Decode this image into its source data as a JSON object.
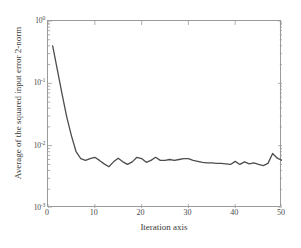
{
  "chart_data": {
    "type": "line",
    "title": "",
    "xlabel": "Iteration axis",
    "ylabel": "Average of the squared input error 2-norm",
    "xlim": [
      0,
      50
    ],
    "ylim": [
      0.001,
      1
    ],
    "yscale": "log",
    "xscale": "linear",
    "grid": false,
    "legend": null,
    "line_color": "#4d4d4d",
    "line_width": 1.3,
    "xticks": [
      0,
      10,
      20,
      30,
      40,
      50
    ],
    "xtick_labels": [
      "0",
      "10",
      "20",
      "30",
      "40",
      "50"
    ],
    "yticks": [
      1,
      0.1,
      0.01,
      0.001
    ],
    "ytick_labels": [
      "10",
      "10",
      "10",
      "10"
    ],
    "ytick_exponents": [
      "0",
      "-1",
      "-2",
      "-3"
    ],
    "series": [
      {
        "name": "average squared input error 2-norm",
        "x": [
          1,
          2,
          3,
          4,
          5,
          6,
          7,
          8,
          9,
          10,
          11,
          12,
          13,
          14,
          15,
          16,
          17,
          18,
          19,
          20,
          21,
          22,
          23,
          24,
          25,
          26,
          27,
          28,
          29,
          30,
          31,
          32,
          33,
          34,
          35,
          36,
          37,
          38,
          39,
          40,
          41,
          42,
          43,
          44,
          45,
          46,
          47,
          48,
          49,
          50
        ],
        "values": [
          0.4,
          0.165,
          0.068,
          0.029,
          0.0145,
          0.008,
          0.0062,
          0.0058,
          0.0062,
          0.0065,
          0.0058,
          0.0051,
          0.0046,
          0.0055,
          0.0063,
          0.0055,
          0.005,
          0.0055,
          0.0065,
          0.0062,
          0.0054,
          0.0058,
          0.0065,
          0.0058,
          0.0058,
          0.006,
          0.0058,
          0.006,
          0.0062,
          0.0062,
          0.0058,
          0.0056,
          0.0054,
          0.0053,
          0.0053,
          0.0052,
          0.0052,
          0.0051,
          0.005,
          0.0056,
          0.005,
          0.0055,
          0.0051,
          0.0053,
          0.005,
          0.0048,
          0.0052,
          0.0075,
          0.0063,
          0.0058
        ]
      }
    ]
  }
}
